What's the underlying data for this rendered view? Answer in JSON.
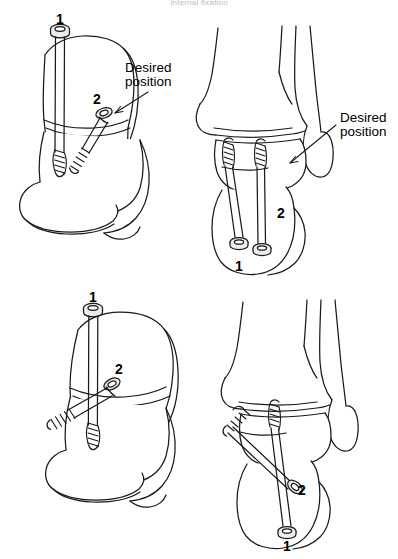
{
  "figure": {
    "title": "Internal fixation",
    "stroke_color": "#1a1a1a",
    "fill_color": "#ffffff",
    "screw_shade": "#e8e8e8"
  },
  "panels": [
    {
      "id": "top-left",
      "view": "lateral oblique view with two screws",
      "annotation": {
        "line1": "Desired",
        "line2": "position"
      },
      "screw_labels": [
        {
          "text": "1"
        },
        {
          "text": "2"
        }
      ]
    },
    {
      "id": "top-right",
      "view": "anteroposterior view with two screws",
      "annotation": {
        "line1": "Desired",
        "line2": "position"
      },
      "screw_labels": [
        {
          "text": "2"
        },
        {
          "text": "1"
        }
      ]
    },
    {
      "id": "bottom-left",
      "view": "lateral oblique view with two screws",
      "annotation": {
        "line1": "",
        "line2": ""
      },
      "screw_labels": [
        {
          "text": "1"
        },
        {
          "text": "2"
        }
      ]
    },
    {
      "id": "bottom-right",
      "view": "anteroposterior view with two screws",
      "annotation": {
        "line1": "",
        "line2": ""
      },
      "screw_labels": [
        {
          "text": "2"
        },
        {
          "text": "1"
        }
      ]
    }
  ],
  "labels": {
    "desired_tl_1": "Desired",
    "desired_tl_2": "position",
    "desired_tr_1": "Desired",
    "desired_tr_2": "position",
    "n_tl_1": "1",
    "n_tl_2": "2",
    "n_tr_2": "2",
    "n_tr_1": "1",
    "n_bl_1": "1",
    "n_bl_2": "2",
    "n_br_2": "2",
    "n_br_1": "1"
  }
}
